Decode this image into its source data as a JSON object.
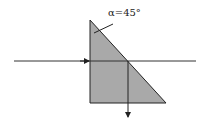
{
  "diagram": {
    "angle_label": "α=45°",
    "colors": {
      "prism_fill": "#a9a9a9",
      "stroke": "#222222",
      "background": "#ffffff"
    },
    "prism": {
      "shape": "right-triangle",
      "vertices": [
        [
          90,
          20
        ],
        [
          90,
          103
        ],
        [
          166,
          103
        ]
      ]
    },
    "incident_ray": {
      "from": [
        14,
        61
      ],
      "to": [
        196,
        61
      ],
      "direction": "right"
    },
    "reflected_ray": {
      "from": [
        128,
        61
      ],
      "to": [
        128,
        118
      ],
      "direction": "down"
    }
  }
}
